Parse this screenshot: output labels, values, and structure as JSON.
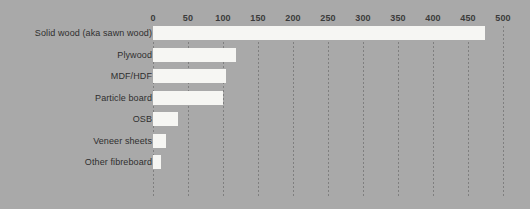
{
  "chart_data": {
    "type": "bar",
    "orientation": "horizontal",
    "title": "",
    "subtitle": "",
    "xlabel": "",
    "ylabel": "",
    "xlim": [
      0,
      500
    ],
    "xticks": [
      0,
      50,
      100,
      150,
      200,
      250,
      300,
      350,
      400,
      450,
      500
    ],
    "xtick_labels": [
      "0",
      "50",
      "100",
      "150",
      "200",
      "250",
      "300",
      "350",
      "400",
      "450",
      "500"
    ],
    "grid": "vertical-dotted",
    "legend": "none",
    "categories": [
      "Solid wood (aka sawn wood)",
      "Plywood",
      "MDF/HDF",
      "Particle board",
      "OSB",
      "Veneer sheets",
      "Other fibreboard"
    ],
    "values": [
      474,
      119,
      104,
      100,
      36,
      19,
      11
    ],
    "bars": [
      {
        "label": "Solid wood (aka sawn wood)",
        "value": 474
      },
      {
        "label": "Plywood",
        "value": 119
      },
      {
        "label": "MDF/HDF",
        "value": 104
      },
      {
        "label": "Particle board",
        "value": 100
      },
      {
        "label": "OSB",
        "value": 36
      },
      {
        "label": "Veneer sheets",
        "value": 19
      },
      {
        "label": "Other fibreboard",
        "value": 11
      }
    ],
    "colors": {
      "background": "#a9a9a9",
      "bar_fill": "#f6f6f3",
      "gridline": "#787878",
      "tick_label_text": "#3b3b3b",
      "category_label_text": "#2f2f2f"
    }
  }
}
